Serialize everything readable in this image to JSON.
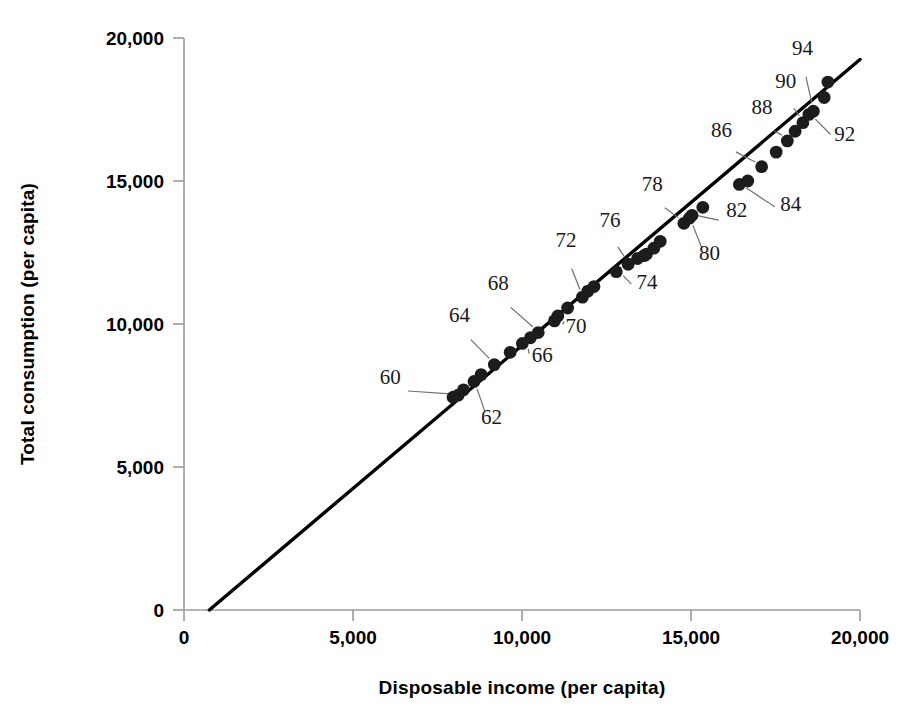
{
  "chart_data": {
    "type": "scatter",
    "title": "",
    "xlabel": "Disposable income (per capita)",
    "ylabel": "Total consumption (per capita)",
    "xlim": [
      0,
      20000
    ],
    "ylim": [
      0,
      20000
    ],
    "xticks": [
      0,
      5000,
      10000,
      15000,
      20000
    ],
    "yticks": [
      0,
      5000,
      10000,
      15000,
      20000
    ],
    "xtick_labels": [
      "0",
      "5,000",
      "10,000",
      "15,000",
      "20,000"
    ],
    "ytick_labels": [
      "0",
      "5,000",
      "10,000",
      "15,000",
      "20,000"
    ],
    "grid": false,
    "legend": false,
    "point_label_field": "year",
    "series": [
      {
        "name": "Annual observations 1959-1995",
        "marker": "filled-circle",
        "color": "#1c1c1c",
        "x": [
          7960,
          8110,
          8270,
          8580,
          8790,
          9180,
          9650,
          10010,
          10250,
          10480,
          10960,
          11060,
          11350,
          11790,
          11950,
          12130,
          12790,
          13140,
          13420,
          13610,
          13680,
          13900,
          14090,
          14790,
          14950,
          15030,
          15350,
          16430,
          16680,
          17090,
          17520,
          17850,
          18080,
          18310,
          18490,
          18620,
          18940,
          19050
        ],
        "y": [
          7440,
          7510,
          7700,
          7990,
          8230,
          8580,
          9010,
          9320,
          9520,
          9700,
          10110,
          10280,
          10560,
          10940,
          11150,
          11310,
          11830,
          12090,
          12290,
          12390,
          12440,
          12650,
          12890,
          13520,
          13700,
          13800,
          14080,
          14880,
          15000,
          15500,
          16010,
          16400,
          16740,
          17040,
          17330,
          17440,
          17920,
          18460
        ],
        "year": [
          "59",
          "60",
          "61",
          "62",
          "63",
          "64",
          "65",
          "66",
          "67",
          "68",
          "69",
          "70",
          "71",
          "72",
          "73",
          "74",
          "75",
          "76",
          "77",
          "78",
          "79",
          "80",
          "81",
          "82",
          "83",
          "84",
          "85",
          "86",
          "87",
          "88",
          "89",
          "90",
          "91",
          "92",
          "93",
          "94",
          "95",
          "96"
        ]
      }
    ],
    "fit_line": {
      "type": "line",
      "x": [
        750,
        20000
      ],
      "y": [
        0,
        19250
      ],
      "color": "#000000"
    },
    "annotations": [
      {
        "label": "60",
        "x": 6100,
        "y": 7900,
        "point_x": 8110,
        "point_y": 7510
      },
      {
        "label": "62",
        "x": 9100,
        "y": 6520,
        "point_x": 8580,
        "point_y": 7990
      },
      {
        "label": "64",
        "x": 8150,
        "y": 10080,
        "point_x": 9180,
        "point_y": 8580
      },
      {
        "label": "66",
        "x": 10600,
        "y": 8680,
        "point_x": 10010,
        "point_y": 9320
      },
      {
        "label": "68",
        "x": 9300,
        "y": 11180,
        "point_x": 10480,
        "point_y": 9700
      },
      {
        "label": "70",
        "x": 11600,
        "y": 9700,
        "point_x": 11060,
        "point_y": 10280
      },
      {
        "label": "72",
        "x": 11300,
        "y": 12680,
        "point_x": 11790,
        "point_y": 10940
      },
      {
        "label": "74",
        "x": 13700,
        "y": 11230,
        "point_x": 12790,
        "point_y": 11830
      },
      {
        "label": "76",
        "x": 12600,
        "y": 13400,
        "point_x": 13140,
        "point_y": 12090
      },
      {
        "label": "78",
        "x": 13850,
        "y": 14650,
        "point_x": 14790,
        "point_y": 13520
      },
      {
        "label": "80",
        "x": 15550,
        "y": 12250,
        "point_x": 14950,
        "point_y": 13700
      },
      {
        "label": "82",
        "x": 16350,
        "y": 13750,
        "point_x": 14950,
        "point_y": 13800
      },
      {
        "label": "84",
        "x": 17950,
        "y": 13950,
        "point_x": 16430,
        "point_y": 14880
      },
      {
        "label": "86",
        "x": 15900,
        "y": 16530,
        "point_x": 17090,
        "point_y": 15500
      },
      {
        "label": "88",
        "x": 17100,
        "y": 17350,
        "point_x": 17850,
        "point_y": 16400
      },
      {
        "label": "90",
        "x": 17800,
        "y": 18240,
        "point_x": 18310,
        "point_y": 17040
      },
      {
        "label": "92",
        "x": 19550,
        "y": 16400,
        "point_x": 18490,
        "point_y": 17330
      },
      {
        "label": "94",
        "x": 18300,
        "y": 19400,
        "point_x": 18620,
        "point_y": 17440
      }
    ]
  },
  "axes": {
    "x_axis_title": "Disposable income (per capita)",
    "y_axis_title": "Total consumption (per capita)",
    "x_ticks": [
      {
        "value": 0,
        "label": "0"
      },
      {
        "value": 5000,
        "label": "5,000"
      },
      {
        "value": 10000,
        "label": "10,000"
      },
      {
        "value": 15000,
        "label": "15,000"
      },
      {
        "value": 20000,
        "label": "20,000"
      }
    ],
    "y_ticks": [
      {
        "value": 0,
        "label": "0"
      },
      {
        "value": 5000,
        "label": "5,000"
      },
      {
        "value": 10000,
        "label": "10,000"
      },
      {
        "value": 15000,
        "label": "15,000"
      },
      {
        "value": 20000,
        "label": "20,000"
      }
    ]
  },
  "colors": {
    "background": "#ffffff",
    "marker": "#1c1c1c",
    "fit_line": "#000000",
    "axis": "#9a9a9a",
    "leader": "#6e6e6e",
    "text": "#000000",
    "annotation_text": "#1a1a1a"
  }
}
